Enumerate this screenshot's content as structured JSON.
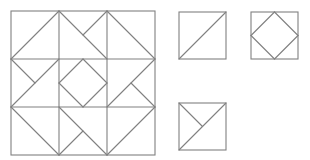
{
  "figure": {
    "width": 310,
    "height": 160,
    "background": "#ffffff",
    "stroke": "#808080",
    "stroke_width": 1.1
  },
  "main_block": {
    "x": 11,
    "y": 11,
    "size": 144,
    "grid": 3,
    "cells": [
      {
        "row": 0,
        "col": 0,
        "lines": [
          [
            "bl",
            "tr"
          ]
        ]
      },
      {
        "row": 0,
        "col": 1,
        "lines": [
          [
            "tl",
            "br"
          ],
          [
            "tr",
            "c"
          ]
        ]
      },
      {
        "row": 0,
        "col": 2,
        "lines": [
          [
            "tl",
            "br"
          ]
        ]
      },
      {
        "row": 1,
        "col": 0,
        "lines": [
          [
            "bl",
            "tr"
          ],
          [
            "tl",
            "c"
          ]
        ]
      },
      {
        "row": 1,
        "col": 1,
        "lines": [
          [
            "mt",
            "mr"
          ],
          [
            "mr",
            "mb"
          ],
          [
            "mb",
            "ml"
          ],
          [
            "ml",
            "mt"
          ]
        ]
      },
      {
        "row": 1,
        "col": 2,
        "lines": [
          [
            "bl",
            "tr"
          ],
          [
            "c",
            "br"
          ]
        ]
      },
      {
        "row": 2,
        "col": 0,
        "lines": [
          [
            "tl",
            "br"
          ]
        ]
      },
      {
        "row": 2,
        "col": 1,
        "lines": [
          [
            "tl",
            "br"
          ],
          [
            "bl",
            "c"
          ]
        ]
      },
      {
        "row": 2,
        "col": 2,
        "lines": [
          [
            "bl",
            "tr"
          ]
        ]
      }
    ]
  },
  "pieces": [
    {
      "name": "half-square-triangle-piece",
      "x": 179,
      "y": 12,
      "size": 47,
      "lines": [
        [
          "bl",
          "tr"
        ]
      ]
    },
    {
      "name": "square-in-square-piece",
      "x": 251,
      "y": 12,
      "size": 47,
      "lines": [
        [
          "mt",
          "mr"
        ],
        [
          "mr",
          "mb"
        ],
        [
          "mb",
          "ml"
        ],
        [
          "ml",
          "mt"
        ]
      ]
    },
    {
      "name": "quarter-triangle-piece",
      "x": 179,
      "y": 103,
      "size": 47,
      "lines": [
        [
          "bl",
          "tr"
        ],
        [
          "tl",
          "c"
        ]
      ]
    }
  ]
}
